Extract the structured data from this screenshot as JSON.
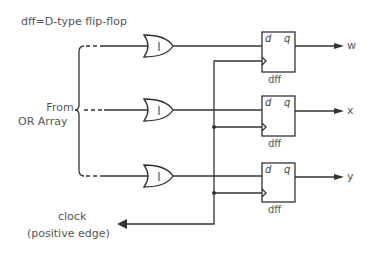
{
  "title": "dff=D-type flip-flop",
  "input_group": {
    "line1": "From",
    "line2": "OR Array"
  },
  "clock": {
    "line1": "clock",
    "line2": "(positive edge)"
  },
  "gates": [
    {
      "type": "OR",
      "symbol": "1"
    },
    {
      "type": "OR",
      "symbol": "1"
    },
    {
      "type": "OR",
      "symbol": "1"
    }
  ],
  "flipflops": [
    {
      "label": "dff",
      "d_pin": "d",
      "q_pin": "q",
      "output": "w"
    },
    {
      "label": "dff",
      "d_pin": "d",
      "q_pin": "q",
      "output": "x"
    },
    {
      "label": "dff",
      "d_pin": "d",
      "q_pin": "q",
      "output": "y"
    }
  ],
  "colors": {
    "line": "#333333",
    "text": "#555555",
    "background": "#ffffff"
  }
}
